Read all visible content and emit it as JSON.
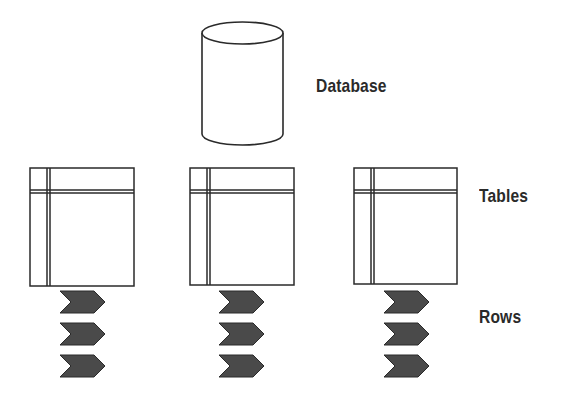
{
  "diagram": {
    "labels": {
      "database": "Database",
      "tables": "Tables",
      "rows": "Rows"
    },
    "nodes": [
      {
        "id": "database",
        "type": "cylinder"
      },
      {
        "id": "table-1",
        "type": "table"
      },
      {
        "id": "table-2",
        "type": "table"
      },
      {
        "id": "table-3",
        "type": "table"
      }
    ],
    "rows_per_table": 3,
    "colors": {
      "stroke": "#2a2a2a",
      "row_fill": "#4a4a4a",
      "background": "#ffffff"
    }
  }
}
